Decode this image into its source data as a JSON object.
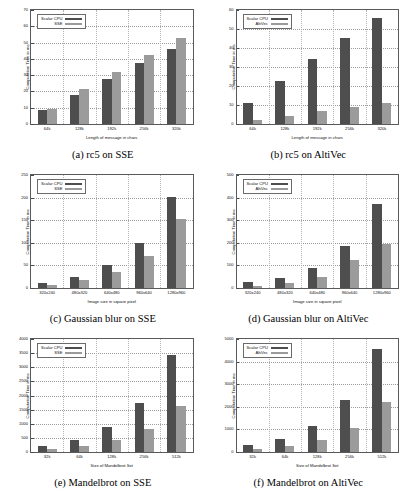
{
  "page": {
    "colors": {
      "series_scalar": "#4e4e4e",
      "series_simd": "#9b9b9b",
      "axis": "#5a5a5a",
      "grid": "#9c9c9c",
      "background": "#ffffff"
    }
  },
  "chart_data": [
    {
      "id": "a",
      "type": "bar",
      "caption": "(a) rc5 on SSE",
      "title": "",
      "xlabel": "Length of message in chars",
      "ylabel": "Computation Time in ms",
      "categories": [
        "64k",
        "128k",
        "192k",
        "256k",
        "320k"
      ],
      "yticks": [
        0,
        10,
        20,
        30,
        40,
        50,
        60,
        70
      ],
      "ylim": [
        0,
        70
      ],
      "grid": true,
      "legend_position": "top-left",
      "series": [
        {
          "name": "Scalar CPU",
          "color": "#4e4e4e",
          "values": [
            8.5,
            18.0,
            27.5,
            37.5,
            46.0
          ]
        },
        {
          "name": "SSE",
          "color": "#9b9b9b",
          "values": [
            9.5,
            21.5,
            32.0,
            42.5,
            53.0
          ]
        }
      ]
    },
    {
      "id": "b",
      "type": "bar",
      "caption": "(b) rc5 on AltiVec",
      "title": "",
      "xlabel": "Length of message in chars",
      "ylabel": "Computation Time in ms",
      "categories": [
        "64k",
        "128k",
        "192k",
        "256k",
        "320k"
      ],
      "yticks": [
        0,
        10,
        20,
        30,
        40,
        50,
        60
      ],
      "ylim": [
        0,
        60
      ],
      "grid": true,
      "legend_position": "top-left",
      "series": [
        {
          "name": "Scalar CPU",
          "color": "#4e4e4e",
          "values": [
            11.0,
            22.5,
            34.0,
            45.5,
            56.0
          ]
        },
        {
          "name": "AltiVec",
          "color": "#9b9b9b",
          "values": [
            2.0,
            4.0,
            7.0,
            9.0,
            11.0
          ]
        }
      ]
    },
    {
      "id": "c",
      "type": "bar",
      "caption": "(c) Gaussian blur on SSE",
      "title": "",
      "xlabel": "Image size in square pixel",
      "ylabel": "Computation Time in ms",
      "categories": [
        "320x240",
        "480x320",
        "640x480",
        "960x640",
        "1280x960"
      ],
      "yticks": [
        0,
        50,
        100,
        150,
        200,
        250
      ],
      "ylim": [
        0,
        250
      ],
      "grid": true,
      "legend_position": "top-left",
      "series": [
        {
          "name": "Scalar CPU",
          "color": "#4e4e4e",
          "values": [
            12,
            25,
            50,
            100,
            201
          ]
        },
        {
          "name": "SSE",
          "color": "#9b9b9b",
          "values": [
            7,
            17,
            36,
            70,
            152
          ]
        }
      ]
    },
    {
      "id": "d",
      "type": "bar",
      "caption": "(d) Gaussian blur on AltiVec",
      "title": "",
      "xlabel": "Image size in square pixel",
      "ylabel": "Computation Time in ms",
      "categories": [
        "320x240",
        "480x320",
        "640x480",
        "960x640",
        "1280x960"
      ],
      "yticks": [
        0,
        100,
        200,
        300,
        400,
        500
      ],
      "ylim": [
        0,
        500
      ],
      "grid": true,
      "legend_position": "top-left",
      "series": [
        {
          "name": "Scalar CPU",
          "color": "#4e4e4e",
          "values": [
            25,
            45,
            90,
            185,
            370
          ]
        },
        {
          "name": "AltiVec",
          "color": "#9b9b9b",
          "values": [
            10,
            20,
            48,
            125,
            195
          ]
        }
      ]
    },
    {
      "id": "e",
      "type": "bar",
      "caption": "(e) Mandelbrot on SSE",
      "title": "",
      "xlabel": "Size of Mandelbrot Set",
      "ylabel": "Computation Time in ms",
      "categories": [
        "32k",
        "64k",
        "128k",
        "256k",
        "512k"
      ],
      "yticks": [
        0,
        500,
        1000,
        1500,
        2000,
        2500,
        3000,
        3500,
        4000
      ],
      "ylim": [
        0,
        4000
      ],
      "grid": true,
      "legend_position": "top-left",
      "series": [
        {
          "name": "Scalar CPU",
          "color": "#4e4e4e",
          "values": [
            220,
            430,
            880,
            1720,
            3420
          ]
        },
        {
          "name": "SSE",
          "color": "#9b9b9b",
          "values": [
            110,
            210,
            430,
            820,
            1630
          ]
        }
      ]
    },
    {
      "id": "f",
      "type": "bar",
      "caption": "(f) Mandelbrot on AltiVec",
      "title": "",
      "xlabel": "Size of Mandelbrot Set",
      "ylabel": "Computation Time in ms",
      "categories": [
        "32k",
        "64k",
        "128k",
        "256k",
        "512k"
      ],
      "yticks": [
        0,
        1000,
        2000,
        3000,
        4000,
        5000
      ],
      "ylim": [
        0,
        5000
      ],
      "grid": true,
      "legend_position": "top-left",
      "series": [
        {
          "name": "Scalar CPU",
          "color": "#4e4e4e",
          "values": [
            290,
            570,
            1150,
            2280,
            4580
          ]
        },
        {
          "name": "AltiVec",
          "color": "#9b9b9b",
          "values": [
            140,
            270,
            540,
            1080,
            2200
          ]
        }
      ]
    }
  ]
}
